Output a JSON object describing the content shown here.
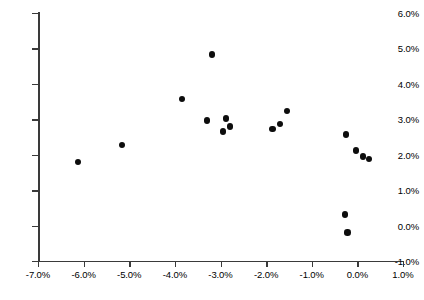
{
  "chart_data": {
    "type": "scatter",
    "title": "",
    "subtitle": "",
    "xlabel": "",
    "ylabel": "",
    "xlim": [
      -7.0,
      1.0
    ],
    "ylim": [
      -1.0,
      6.0
    ],
    "xticks": [
      -7.0,
      -6.0,
      -5.0,
      -4.0,
      -3.0,
      -2.0,
      -1.0,
      0.0,
      1.0
    ],
    "yticks": [
      -1.0,
      0.0,
      1.0,
      2.0,
      3.0,
      4.0,
      5.0,
      6.0
    ],
    "xtick_labels": [
      "-7.0%",
      "-6.0%",
      "-5.0%",
      "-4.0%",
      "-3.0%",
      "-2.0%",
      "-1.0%",
      "0.0%",
      "1.0%"
    ],
    "ytick_labels": [
      "-1.0%",
      "0.0%",
      "1.0%",
      "2.0%",
      "3.0%",
      "4.0%",
      "5.0%",
      "6.0%"
    ],
    "grid": false,
    "legend": null,
    "marker": {
      "shape": "circle",
      "color": "#0d0d0d",
      "size": 6.4
    },
    "series": [
      {
        "name": "series-1",
        "points": [
          {
            "x": -6.12,
            "y": 1.8
          },
          {
            "x": -5.16,
            "y": 2.28
          },
          {
            "x": -3.85,
            "y": 3.58
          },
          {
            "x": -3.3,
            "y": 2.97
          },
          {
            "x": -3.18,
            "y": 4.83
          },
          {
            "x": -2.94,
            "y": 2.66
          },
          {
            "x": -2.88,
            "y": 3.02
          },
          {
            "x": -2.79,
            "y": 2.8
          },
          {
            "x": -1.86,
            "y": 2.72
          },
          {
            "x": -1.7,
            "y": 2.87
          },
          {
            "x": -1.54,
            "y": 3.24
          },
          {
            "x": -0.25,
            "y": 2.57
          },
          {
            "x": -0.03,
            "y": 2.12
          },
          {
            "x": 0.12,
            "y": 1.95
          },
          {
            "x": 0.26,
            "y": 1.88
          },
          {
            "x": -0.27,
            "y": 0.31
          },
          {
            "x": -0.22,
            "y": -0.2
          }
        ]
      }
    ]
  },
  "geometry": {
    "x_origin_px": 38,
    "y_top_px": 13,
    "px_per_x_unit": 45.625,
    "px_per_y_unit": 35.43
  }
}
